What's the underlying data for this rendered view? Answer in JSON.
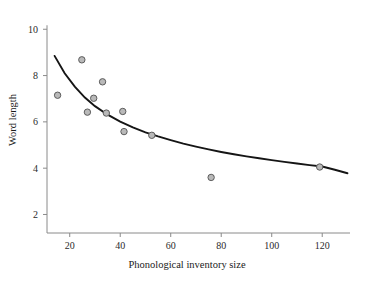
{
  "chart_data": {
    "type": "scatter",
    "title": "",
    "xlabel": "Phonological inventory size",
    "ylabel": "Word length",
    "xlim": [
      11,
      131
    ],
    "ylim": [
      1.2,
      10.4
    ],
    "xticks": [
      20,
      40,
      60,
      80,
      100,
      120
    ],
    "yticks": [
      2,
      4,
      6,
      8,
      10
    ],
    "grid": false,
    "legend": null,
    "points": [
      {
        "x": 15.2,
        "y": 7.15
      },
      {
        "x": 24.8,
        "y": 8.68
      },
      {
        "x": 27.0,
        "y": 6.42
      },
      {
        "x": 29.5,
        "y": 7.02
      },
      {
        "x": 33.0,
        "y": 7.73
      },
      {
        "x": 34.5,
        "y": 6.38
      },
      {
        "x": 41.0,
        "y": 6.45
      },
      {
        "x": 41.5,
        "y": 5.58
      },
      {
        "x": 52.5,
        "y": 5.42
      },
      {
        "x": 76.0,
        "y": 3.6
      },
      {
        "x": 119.0,
        "y": 4.05
      }
    ],
    "series": [
      {
        "name": "fitted curve",
        "type": "line",
        "x": [
          14,
          18,
          22,
          26,
          30,
          35,
          40,
          45,
          50,
          55,
          60,
          65,
          70,
          75,
          80,
          85,
          90,
          95,
          100,
          105,
          110,
          115,
          120,
          125,
          130
        ],
        "y": [
          8.85,
          8.1,
          7.52,
          7.05,
          6.68,
          6.31,
          6.01,
          5.76,
          5.55,
          5.37,
          5.21,
          5.06,
          4.93,
          4.81,
          4.7,
          4.6,
          4.51,
          4.43,
          4.35,
          4.27,
          4.2,
          4.13,
          4.07,
          3.93,
          3.78
        ]
      }
    ],
    "colors": {
      "point_fill": "#b9b9b9",
      "point_stroke": "#5d5d5d",
      "curve": "#151515",
      "axis": "#8a8a8a",
      "text": "#1a1a1a",
      "background": "#ffffff"
    }
  }
}
